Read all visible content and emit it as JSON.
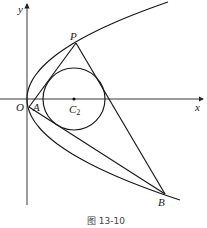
{
  "figure": {
    "caption": "图 13-10",
    "axes": {
      "x_label": "x",
      "y_label": "y"
    },
    "points": {
      "origin": "O",
      "A": "A",
      "P": "P",
      "B": "B",
      "center": "C",
      "center_subscript": "2"
    },
    "elements": [
      "parabola opening right with vertex at O",
      "circle C2 centered on x-axis",
      "triangle PAB with vertices on parabola, circle inscribed"
    ]
  }
}
